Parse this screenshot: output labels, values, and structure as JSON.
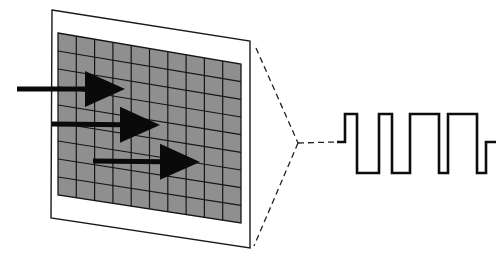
{
  "diagram": {
    "colors": {
      "background": "#ffffff",
      "frame_fill": "#ffffff",
      "frame_stroke": "#1a1a1a",
      "grid_fill": "#8f8f8f",
      "grid_lines": "#161616",
      "arrow": "#0a0a0a",
      "dashed": "#222222",
      "signal": "#0d0d0d"
    },
    "frame": {
      "corners": [
        [
          52,
          10
        ],
        [
          250,
          41
        ],
        [
          250,
          248
        ],
        [
          51,
          218
        ]
      ]
    },
    "grid": {
      "columns": 10,
      "rows": 9,
      "corners": [
        [
          58,
          33
        ],
        [
          241,
          64
        ],
        [
          241,
          223
        ],
        [
          58,
          195
        ]
      ]
    },
    "arrows": [
      {
        "tail": [
          17,
          89
        ],
        "tip": [
          125,
          89
        ]
      },
      {
        "tail": [
          52,
          124
        ],
        "tip": [
          160,
          125
        ]
      },
      {
        "tail": [
          93,
          161
        ],
        "tip": [
          200,
          162
        ]
      }
    ],
    "zoom_lines": {
      "top": [
        [
          256,
          48
        ],
        [
          298,
          143
        ]
      ],
      "bottom": [
        [
          298,
          143
        ],
        [
          254,
          246
        ]
      ],
      "lead": [
        [
          298,
          143
        ],
        [
          336,
          142
        ]
      ]
    },
    "signal": {
      "type": "square-wave",
      "levels": {
        "high": 114,
        "mid": 142,
        "low": 173
      },
      "points": [
        [
          337,
          142
        ],
        [
          345,
          142
        ],
        [
          345,
          114
        ],
        [
          357,
          114
        ],
        [
          357,
          173
        ],
        [
          379,
          173
        ],
        [
          379,
          114
        ],
        [
          392,
          114
        ],
        [
          392,
          173
        ],
        [
          410,
          173
        ],
        [
          410,
          114
        ],
        [
          439,
          114
        ],
        [
          439,
          173
        ],
        [
          448,
          173
        ],
        [
          448,
          114
        ],
        [
          477,
          114
        ],
        [
          477,
          173
        ],
        [
          486,
          173
        ],
        [
          486,
          142
        ],
        [
          496,
          142
        ]
      ]
    }
  }
}
